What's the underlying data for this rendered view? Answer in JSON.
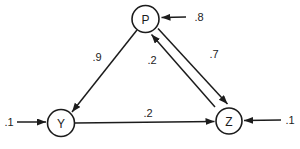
{
  "diagram": {
    "type": "path-diagram",
    "background_color": "#ffffff",
    "line_color": "#1c1c1c",
    "nodes": [
      {
        "id": "P",
        "label": "P"
      },
      {
        "id": "Y",
        "label": "Y"
      },
      {
        "id": "Z",
        "label": "Z"
      }
    ],
    "edges": [
      {
        "from": "P",
        "to": "Y",
        "label": ".9"
      },
      {
        "from": "Z",
        "to": "P",
        "label": ".2"
      },
      {
        "from": "P",
        "to": "Z",
        "label": ".7"
      },
      {
        "from": "Y",
        "to": "Z",
        "label": ".2"
      },
      {
        "from": "external-right",
        "to": "P",
        "label": ".8"
      },
      {
        "from": "external-left",
        "to": "Y",
        "label": ".1"
      },
      {
        "from": "external-right",
        "to": "Z",
        "label": ".1"
      }
    ]
  }
}
